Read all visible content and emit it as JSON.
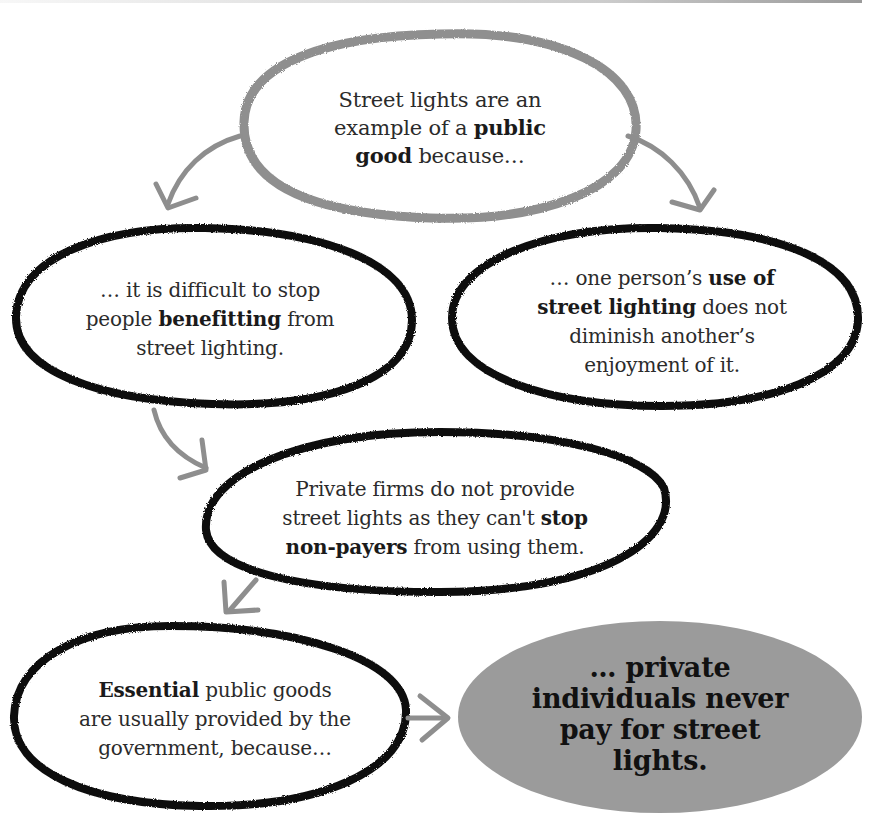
{
  "diagram": {
    "colors": {
      "background": "#ffffff",
      "top_outline": "#8f8f8f",
      "node_outline": "#111111",
      "arrow": "#8e8e8e",
      "conclusion_fill": "#9b9b9b",
      "text": "#2b2b2b"
    },
    "nodes": {
      "top": {
        "segments": [
          {
            "text": "Street lights are an example of a ",
            "bold": false
          },
          {
            "text": "public good",
            "bold": true
          },
          {
            "text": " because…",
            "bold": false
          }
        ],
        "t0": "Street lights are an",
        "t1": "example of a ",
        "t2": "public",
        "t3": "good",
        "t4": " because…"
      },
      "left": {
        "t0": "… it is difficult to stop",
        "t1": "people ",
        "t2": "benefitting",
        "t3": " from",
        "t4": "street lighting."
      },
      "right": {
        "t0": "… one person’s ",
        "t1": "use of",
        "t2": "street lighting",
        "t3": " does not",
        "t4": "diminish another’s",
        "t5": "enjoyment of it."
      },
      "middle": {
        "t0": "Private firms do not provide",
        "t1": "street lights as they can't ",
        "t2": "stop",
        "t3": "non-payers",
        "t4": " from using them."
      },
      "bottom_left": {
        "t0": "Essential",
        "t1": " public goods",
        "t2": "are usually provided by the",
        "t3": "government, because…"
      },
      "bottom_right": {
        "t0": "… private",
        "t1": "individuals never",
        "t2": "pay for street",
        "t3": "lights."
      }
    },
    "edges": [
      {
        "from": "top",
        "to": "left",
        "icon": "curved-arrow-down-left"
      },
      {
        "from": "top",
        "to": "right",
        "icon": "curved-arrow-down-right"
      },
      {
        "from": "left",
        "to": "middle",
        "icon": "curved-arrow-down-right"
      },
      {
        "from": "middle",
        "to": "bottom_left",
        "icon": "arrow-down-left"
      },
      {
        "from": "bottom_left",
        "to": "bottom_right",
        "icon": "arrow-right"
      }
    ]
  }
}
